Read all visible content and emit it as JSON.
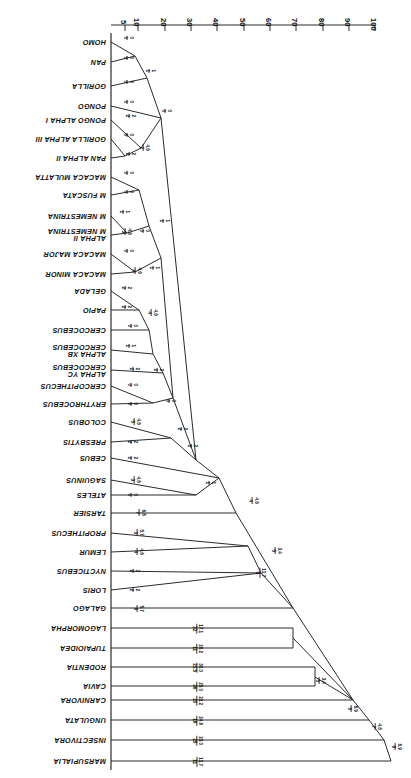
{
  "figure": {
    "type": "phylogram",
    "orientation": "printed-upside-down",
    "axis_title": ""
  },
  "axis": {
    "name": "distance-axis",
    "ticks": [
      "100",
      "90",
      "80",
      "70",
      "60",
      "50",
      "40",
      "30",
      "20",
      "10",
      "5"
    ],
    "values": [
      100,
      90,
      80,
      70,
      60,
      50,
      40,
      30,
      20,
      10,
      5
    ],
    "min": 0,
    "max": 105
  },
  "taxa": [
    {
      "id": "marsupialia",
      "label": "MARSUPIALIA",
      "label2": ""
    },
    {
      "id": "insectivora",
      "label": "INSECTIVORA",
      "label2": ""
    },
    {
      "id": "ungulata",
      "label": "UNGULATA",
      "label2": ""
    },
    {
      "id": "carnivora",
      "label": "CARNIVORA",
      "label2": ""
    },
    {
      "id": "cavia",
      "label": "CAVIA",
      "label2": ""
    },
    {
      "id": "rodentia",
      "label": "RODENTIA",
      "label2": ""
    },
    {
      "id": "tupaioidea",
      "label": "TUPAIOIDEA",
      "label2": ""
    },
    {
      "id": "lagomorpha",
      "label": "LAGOMORPHA",
      "label2": ""
    },
    {
      "id": "galago",
      "label": "GALAGO",
      "label2": ""
    },
    {
      "id": "loris",
      "label": "LORIS",
      "label2": ""
    },
    {
      "id": "nycticebus",
      "label": "NYCTICEBUS",
      "label2": ""
    },
    {
      "id": "lemur",
      "label": "LEMUR",
      "label2": ""
    },
    {
      "id": "propithecus",
      "label": "PROPITHECUS",
      "label2": ""
    },
    {
      "id": "tarsier",
      "label": "TARSIER",
      "label2": ""
    },
    {
      "id": "ateles",
      "label": "ATELES",
      "label2": ""
    },
    {
      "id": "saguinus",
      "label": "SAGUINUS",
      "label2": ""
    },
    {
      "id": "cebus",
      "label": "CEBUS",
      "label2": ""
    },
    {
      "id": "presbytis",
      "label": "PRESBYTIS",
      "label2": ""
    },
    {
      "id": "colobus",
      "label": "COLOBUS",
      "label2": ""
    },
    {
      "id": "erythrocebus",
      "label": "ERYTHROCEBUS",
      "label2": ""
    },
    {
      "id": "cercopithecus",
      "label": "CERCOPITHECUS",
      "label2": ""
    },
    {
      "id": "cercocebus-alpha-yc",
      "label": "CERCOCEBUS",
      "label2": "ALPHA YC"
    },
    {
      "id": "cercocebus-alpha-xb",
      "label": "CERCOCEBUS",
      "label2": "ALPHA XB"
    },
    {
      "id": "cercocebus",
      "label": "CERCOCEBUS",
      "label2": ""
    },
    {
      "id": "papio",
      "label": "PAPIO",
      "label2": ""
    },
    {
      "id": "gelada",
      "label": "GELADA",
      "label2": ""
    },
    {
      "id": "macaca-minor",
      "label": "MACACA MINOR",
      "label2": ""
    },
    {
      "id": "macaca-major",
      "label": "MACACA MAJOR",
      "label2": ""
    },
    {
      "id": "m-nemestrina-alpha-ii",
      "label": "M NEMESTRINA",
      "label2": "ALPHA II"
    },
    {
      "id": "m-nemestrina",
      "label": "M NEMESTRINA",
      "label2": ""
    },
    {
      "id": "m-fuscata",
      "label": "M FUSCATA",
      "label2": ""
    },
    {
      "id": "macaca-mulatta",
      "label": "MACACA MULATTA",
      "label2": ""
    },
    {
      "id": "pan-alpha-ii",
      "label": "PAN  ALPHA II",
      "label2": ""
    },
    {
      "id": "gorilla-alpha-iii",
      "label": "GORILLA  ALPHA III",
      "label2": ""
    },
    {
      "id": "pongo-alpha-i",
      "label": "PONGO  ALPHA I",
      "label2": ""
    },
    {
      "id": "pongo",
      "label": "PONGO",
      "label2": ""
    },
    {
      "id": "gorilla",
      "label": "GORILLA",
      "label2": ""
    },
    {
      "id": "pan",
      "label": "PAN",
      "label2": ""
    },
    {
      "id": "homo",
      "label": "HOMO",
      "label2": ""
    }
  ],
  "branch_labels": [
    {
      "id": "bl-marsupialia",
      "num": "11.7",
      "den": "11"
    },
    {
      "id": "bl-insectivora",
      "num": "23.0",
      "den": "25"
    },
    {
      "id": "bl-ungulata",
      "num": "24.6",
      "den": "18"
    },
    {
      "id": "bl-carnivora",
      "num": "22.2",
      "den": "20"
    },
    {
      "id": "bl-cavia",
      "num": "25.0",
      "den": "36"
    },
    {
      "id": "bl-rodentia",
      "num": "30.0",
      "den": "21.5"
    },
    {
      "id": "bl-tupaioidea",
      "num": "26.2",
      "den": "11"
    },
    {
      "id": "bl-lagomorpha",
      "num": "17.1",
      "den": "22"
    },
    {
      "id": "bl-root-a",
      "num": "6.9",
      "den": "8"
    },
    {
      "id": "bl-root-b",
      "num": "4.6",
      "den": "7"
    },
    {
      "id": "bl-root-c",
      "num": "6.9",
      "den": "5"
    },
    {
      "id": "bl-root-d",
      "num": "3.4",
      "den": "5"
    },
    {
      "id": "bl-prosimian-a",
      "num": "11.7",
      "den": "8"
    },
    {
      "id": "bl-prosimian-b",
      "num": "3.4",
      "den": "5"
    },
    {
      "id": "bl-anthropoid",
      "num": "4.6",
      "den": "4"
    },
    {
      "id": "bl-galago",
      "num": "5.7",
      "den": "6"
    },
    {
      "id": "bl-loris",
      "num": "2",
      "den": "2"
    },
    {
      "id": "bl-nycticebus",
      "num": "3",
      "den": "2"
    },
    {
      "id": "bl-lemur",
      "num": "4.6",
      "den": "4"
    },
    {
      "id": "bl-propithecus",
      "num": "5.7",
      "den": "3"
    },
    {
      "id": "bl-tarsier",
      "num": "6.8",
      "den": "7"
    },
    {
      "id": "bl-ateles",
      "num": "0",
      "den": "0"
    },
    {
      "id": "bl-saguinus",
      "num": "4.6",
      "den": "3"
    },
    {
      "id": "bl-cebus",
      "num": "2",
      "den": "2"
    },
    {
      "id": "bl-platyrrhine",
      "num": "1",
      "den": "1"
    },
    {
      "id": "bl-presbytis",
      "num": "2",
      "den": "2"
    },
    {
      "id": "bl-colobus",
      "num": "4.6",
      "den": "5"
    },
    {
      "id": "bl-colobine",
      "num": "2",
      "den": "2"
    },
    {
      "id": "bl-catarrhine",
      "num": "2",
      "den": "2"
    },
    {
      "id": "bl-erythrocebus",
      "num": "0",
      "den": "0"
    },
    {
      "id": "bl-cercopithecus",
      "num": "0",
      "den": "0"
    },
    {
      "id": "bl-cercop-node",
      "num": "0",
      "den": "0"
    },
    {
      "id": "bl-cerco-yc",
      "num": "2",
      "den": "2"
    },
    {
      "id": "bl-cerco-xb",
      "num": "1",
      "den": "1"
    },
    {
      "id": "bl-cercocebus",
      "num": "0",
      "den": "0"
    },
    {
      "id": "bl-cerco-node",
      "num": "2",
      "den": "2"
    },
    {
      "id": "bl-papio-node",
      "num": "4.6",
      "den": "4"
    },
    {
      "id": "bl-papio",
      "num": "2",
      "den": "2"
    },
    {
      "id": "bl-gelada",
      "num": "2",
      "den": "2"
    },
    {
      "id": "bl-macaca-minor",
      "num": "4.6",
      "den": "4"
    },
    {
      "id": "bl-macaca-major",
      "num": "0",
      "den": "0"
    },
    {
      "id": "bl-macaca-node",
      "num": "1",
      "den": "1"
    },
    {
      "id": "bl-nemest-ii",
      "num": "4.6",
      "den": "3"
    },
    {
      "id": "bl-nemest",
      "num": "1",
      "den": "1"
    },
    {
      "id": "bl-nemest-node",
      "num": "0",
      "den": "0"
    },
    {
      "id": "bl-fuscata",
      "num": "0",
      "den": "0"
    },
    {
      "id": "bl-mulatta",
      "num": "0",
      "den": "0"
    },
    {
      "id": "bl-macaque-node",
      "num": "1",
      "den": "1"
    },
    {
      "id": "bl-pan-ii",
      "num": "2",
      "den": "2"
    },
    {
      "id": "bl-gorilla-iii",
      "num": "0",
      "den": "0"
    },
    {
      "id": "bl-alpha-node",
      "num": "4.6",
      "den": "2"
    },
    {
      "id": "bl-pongo-i",
      "num": "2",
      "den": "2"
    },
    {
      "id": "bl-pongo",
      "num": "0",
      "den": "0"
    },
    {
      "id": "bl-hominoid",
      "num": "0",
      "den": "0"
    },
    {
      "id": "bl-gorilla",
      "num": "0",
      "den": "0"
    },
    {
      "id": "bl-homininae",
      "num": "1",
      "den": "1"
    },
    {
      "id": "bl-pan",
      "num": "0",
      "den": "0"
    },
    {
      "id": "bl-homo",
      "num": "0",
      "den": "0"
    }
  ]
}
